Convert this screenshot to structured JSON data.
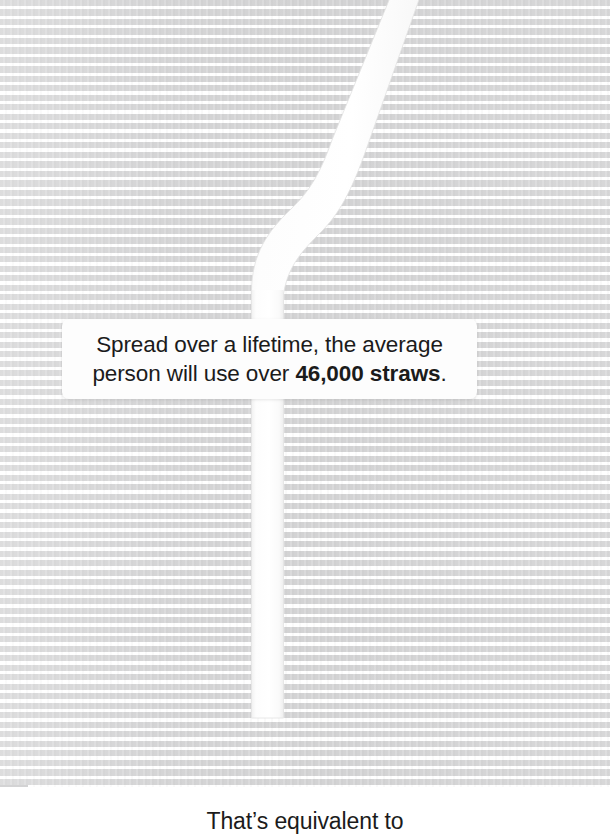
{
  "poster": {
    "background_color": "#d3d3d4",
    "stripe_highlight_color": "#ffffff",
    "straw_color": "#fcfcfc",
    "text_color": "#1b1b1b",
    "callout_background": "#fdfdfd"
  },
  "callout": {
    "line1": "Spread over a lifetime, the average",
    "line2_prefix": "person will use over ",
    "line2_emphasis": "46,000 straws",
    "line2_suffix": "."
  },
  "bottom": {
    "caption": "That’s equivalent to"
  },
  "graphic": {
    "straw_label": "bendy-drinking-straw"
  }
}
